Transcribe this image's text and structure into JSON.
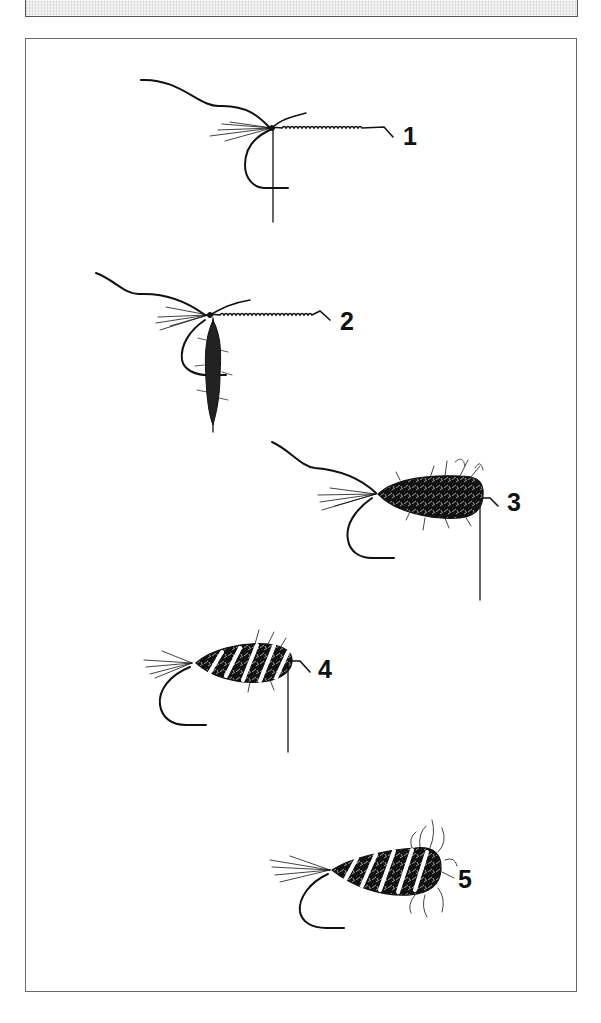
{
  "figure": {
    "steps": [
      {
        "number": "1",
        "label": "1",
        "stage": "tail and ribbing tied in"
      },
      {
        "number": "2",
        "label": "2",
        "stage": "dubbing loop twisted"
      },
      {
        "number": "3",
        "label": "3",
        "stage": "dubbed body wound"
      },
      {
        "number": "4",
        "label": "4",
        "stage": "ribbing wound over body"
      },
      {
        "number": "5",
        "label": "5",
        "stage": "finished fly, body picked out"
      }
    ]
  },
  "colors": {
    "ink": "#111111",
    "frame": "#6a6a6a",
    "top_box_fill": "#ececec",
    "background": "#ffffff"
  }
}
